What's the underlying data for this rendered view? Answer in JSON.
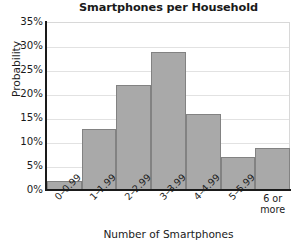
{
  "chart_data": {
    "type": "bar",
    "title": "Smartphones per Household",
    "xlabel": "Number of Smartphones",
    "ylabel": "Probability",
    "categories": [
      "0–0.99",
      "1–1.99",
      "2–2.99",
      "3–3.99",
      "4–4.99",
      "5–5.99",
      "6 or\nmore"
    ],
    "values": [
      2,
      13,
      22,
      29,
      16,
      7,
      9
    ],
    "ylim": [
      0,
      35
    ],
    "yticks": [
      "0%",
      "5%",
      "10%",
      "15%",
      "20%",
      "25%",
      "30%",
      "35%"
    ],
    "ytick_values": [
      0,
      5,
      10,
      15,
      20,
      25,
      30,
      35
    ],
    "grid": true,
    "legend": "none",
    "bar_color": "#a9a9a9",
    "bar_border_color": "#828282",
    "gridline_color": "#e2e2e2",
    "axis_color": "#1a1a1a",
    "background": "#ffffff",
    "last_category_lines": [
      "6 or",
      "more"
    ]
  }
}
